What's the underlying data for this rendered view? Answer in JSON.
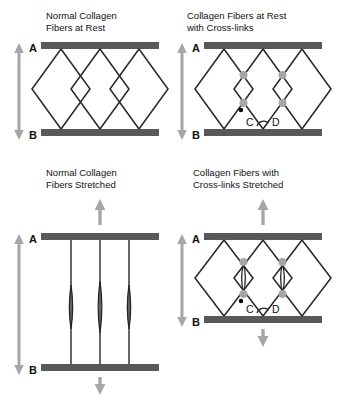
{
  "figure": {
    "background_color": "#ffffff",
    "bar_color": "#595959",
    "fiber_color": "#262626",
    "arrow_color": "#a6a6a6",
    "crosslink_color": "#a6a6a6",
    "marker_color": "#000000",
    "text_color": "#111111"
  },
  "panels": [
    {
      "id": "normal-at-rest",
      "title": "Normal Collagen\nFibers at Rest",
      "plate_labels": {
        "top": "A",
        "bottom": "B"
      },
      "span_arrow": "double-vertical",
      "fiber_state": "rest",
      "crosslinks": false,
      "node_labels": [],
      "load_arrows": [],
      "fiber_count": 3
    },
    {
      "id": "crosslinks-at-rest",
      "title": "Collagen Fibers at Rest\nwith Cross-links",
      "plate_labels": {
        "top": "A",
        "bottom": "B"
      },
      "span_arrow": "double-vertical",
      "fiber_state": "rest",
      "crosslinks": true,
      "node_labels": [
        "C",
        "D"
      ],
      "load_arrows": [],
      "fiber_count": 3
    },
    {
      "id": "normal-stretched",
      "title": "Normal Collagen\nFibers Stretched",
      "plate_labels": {
        "top": "A",
        "bottom": "B"
      },
      "span_arrow": "double-vertical",
      "fiber_state": "stretched",
      "crosslinks": false,
      "node_labels": [],
      "load_arrows": [
        "up",
        "down"
      ],
      "fiber_count": 3
    },
    {
      "id": "crosslinks-stretched",
      "title": "Collagen Fibers with\nCross-links Stretched",
      "plate_labels": {
        "top": "A",
        "bottom": "B"
      },
      "span_arrow": "double-vertical",
      "fiber_state": "stretched",
      "crosslinks": true,
      "node_labels": [
        "C",
        "D"
      ],
      "load_arrows": [
        "up",
        "down"
      ],
      "fiber_count": 3
    }
  ]
}
